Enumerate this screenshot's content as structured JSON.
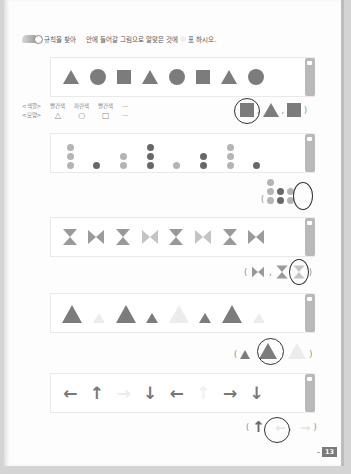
{
  "instruction": {
    "part1": "규칙을 찾아",
    "part2": "안에 들어갈 그림으로 알맞은 것에",
    "part3": "표 하시오."
  },
  "problem1": {
    "sequence": [
      "triangle",
      "circle",
      "square",
      "triangle",
      "circle",
      "square",
      "triangle",
      "circle"
    ],
    "hint": {
      "color_label": "<색깔>",
      "shape_label": "<모양>",
      "colors": [
        "빨간색",
        "파란색",
        "빨간색",
        "---"
      ],
      "shapes": [
        "△",
        "○",
        "□",
        "---"
      ]
    },
    "options": [
      "square",
      "triangle",
      "square"
    ],
    "selected_index": 0,
    "paren_open": "(",
    "paren_close": ")",
    "sep": ","
  },
  "problem2": {
    "sequence": [
      [
        "light",
        "light",
        "light"
      ],
      [
        "dark"
      ],
      [
        "light",
        "light"
      ],
      [
        "dark",
        "dark",
        "dark"
      ],
      [
        "light"
      ],
      [
        "dark",
        "dark"
      ],
      [
        "light",
        "light",
        "light"
      ],
      [
        "dark"
      ]
    ],
    "options": [
      [
        "light",
        "light",
        "light"
      ],
      [
        "dark",
        "dark"
      ],
      [
        "light",
        "light"
      ]
    ],
    "selected_index": 2
  },
  "problem3": {
    "sequence": [
      "hourglass",
      "bowtie",
      "hourglass",
      "bowtie-pale",
      "hourglass",
      "bowtie-pale",
      "hourglass",
      "bowtie"
    ],
    "options": [
      "bowtie",
      "hourglass",
      "hourglass-pale"
    ],
    "selected_index": 2
  },
  "problem4": {
    "sequence": [
      "large-dark",
      "small-pale",
      "large-dark",
      "small-dark",
      "large-pale",
      "small-dark",
      "large-dark",
      "small-pale"
    ],
    "options": [
      "small-dark",
      "large-dark",
      "large-pale"
    ],
    "selected_index": 1
  },
  "problem5": {
    "sequence": [
      "←",
      "↑",
      "→",
      "↓",
      "←",
      "↑",
      "→",
      "↓"
    ],
    "sequence_shades": [
      "dark",
      "dark",
      "pale",
      "dark",
      "dark",
      "pale",
      "dark",
      "dark"
    ],
    "options": [
      "↑",
      "←",
      "→"
    ],
    "option_shades": [
      "dark",
      "pale",
      "pale"
    ],
    "selected_index": 1
  },
  "page_number": "13",
  "colors": {
    "shape_gray": "#7c7c7c",
    "light_gray": "#b4b4b4",
    "dark_gray": "#686868",
    "ring": "#333333"
  }
}
